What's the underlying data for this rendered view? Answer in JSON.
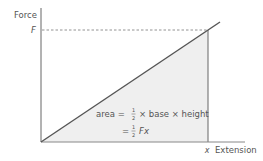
{
  "diagram": {
    "type": "force-extension graph",
    "y_axis_label": "Force",
    "x_axis_label": "Extension",
    "y_marker": "F",
    "x_marker": "x",
    "formula_line1": {
      "prefix": "area =",
      "fraction_num": "1",
      "fraction_den": "2",
      "suffix": "× base × height"
    },
    "formula_line2": {
      "prefix": "=",
      "fraction_num": "1",
      "fraction_den": "2",
      "suffix": "Fx"
    },
    "colors": {
      "axis": "#666666",
      "line": "#555555",
      "fill": "#efefef",
      "dashed": "#777777",
      "text": "#555555"
    }
  }
}
